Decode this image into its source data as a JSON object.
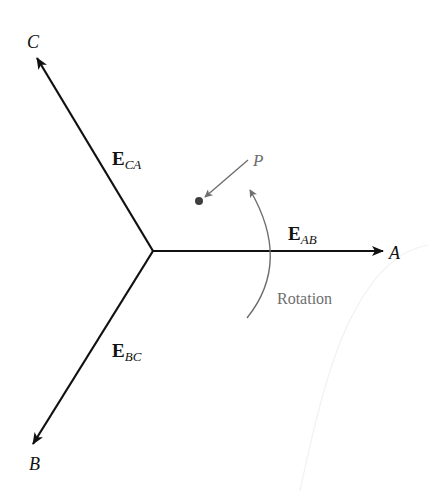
{
  "diagram": {
    "type": "phasor-diagram",
    "center": {
      "x": 153,
      "y": 251
    },
    "phasors": [
      {
        "id": "AB",
        "vector_symbol": "E",
        "subscript": "AB",
        "endpoint_label": "A",
        "tip": {
          "x": 383,
          "y": 251
        },
        "label_pos": {
          "x": 288,
          "y": 240
        },
        "endpoint_label_pos": {
          "x": 389,
          "y": 259
        }
      },
      {
        "id": "CA",
        "vector_symbol": "E",
        "subscript": "CA",
        "endpoint_label": "C",
        "tip": {
          "x": 37,
          "y": 58
        },
        "label_pos": {
          "x": 112,
          "y": 165
        },
        "endpoint_label_pos": {
          "x": 27,
          "y": 48
        }
      },
      {
        "id": "BC",
        "vector_symbol": "E",
        "subscript": "BC",
        "endpoint_label": "B",
        "tip": {
          "x": 33,
          "y": 444
        },
        "label_pos": {
          "x": 112,
          "y": 357
        },
        "endpoint_label_pos": {
          "x": 29,
          "y": 470
        }
      }
    ],
    "point": {
      "label": "P",
      "dot": {
        "x": 199,
        "y": 201
      },
      "label_pos": {
        "x": 253,
        "y": 166
      }
    },
    "rotation": {
      "label": "Rotation",
      "label_pos": {
        "x": 277,
        "y": 304
      }
    },
    "colors": {
      "phasor": "#111111",
      "annotation": "#6e6e6e",
      "dot": "#3f3f3f",
      "background": "#ffffff"
    }
  }
}
